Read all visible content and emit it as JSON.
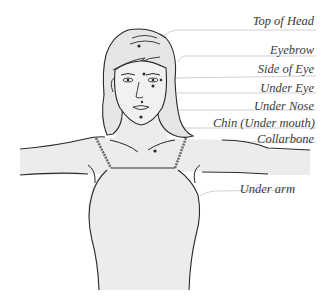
{
  "diagram": {
    "colors": {
      "background": "#ffffff",
      "fill": "#ececec",
      "ink": "#2a2a2a",
      "leader": "#bdbdbd",
      "label": "#3a3a3a"
    },
    "labels": [
      {
        "id": "top-of-head",
        "text": "Top of Head",
        "top": 14
      },
      {
        "id": "eyebrow",
        "text": "Eyebrow",
        "top": 43
      },
      {
        "id": "side-of-eye",
        "text": "Side of Eye",
        "top": 62
      },
      {
        "id": "under-eye",
        "text": "Under Eye",
        "top": 81
      },
      {
        "id": "under-nose",
        "text": "Under Nose",
        "top": 99
      },
      {
        "id": "chin",
        "text": "Chin (Under mouth)",
        "top": 117
      },
      {
        "id": "collarbone",
        "text": "Collarbone",
        "top": 133
      },
      {
        "id": "under-arm",
        "text": "Under arm",
        "top": 183
      }
    ]
  }
}
